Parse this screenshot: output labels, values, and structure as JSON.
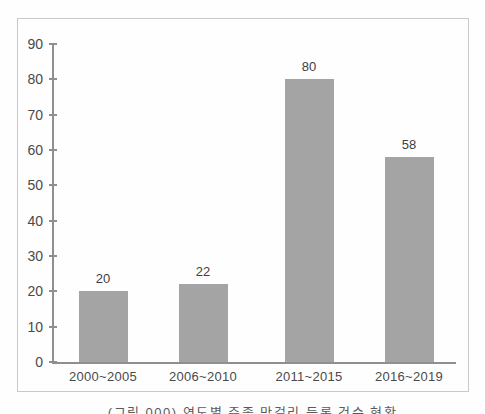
{
  "figure": {
    "background_color": "#fefefe",
    "frame_border_color": "#c9c9c9"
  },
  "chart_data": {
    "type": "bar",
    "title": "",
    "xlabel": "",
    "ylabel": "",
    "categories": [
      "2000~2005",
      "2006~2010",
      "2011~2015",
      "2016~2019"
    ],
    "values": [
      20,
      22,
      80,
      58
    ],
    "data_labels_shown": true,
    "ylim": [
      0,
      90
    ],
    "yticks": [
      0,
      10,
      20,
      30,
      40,
      50,
      60,
      70,
      80,
      90
    ],
    "grid": false,
    "legend": "none",
    "bar_color": "#a4a4a4",
    "axis_color": "#8f8f8f",
    "tick_label_color": "#4a4a4a",
    "value_label_color": "#3f3f3f"
  },
  "caption": {
    "text": "(그림 000) 연도별 주종 막걸리 등록 건수 현황",
    "color": "#5a5a5a"
  }
}
